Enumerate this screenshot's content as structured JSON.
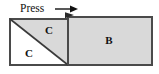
{
  "figure": {
    "background_color": "#ffffff",
    "outline_color": "#4a4a4a",
    "fill_gray": "#d9d9d9",
    "fill_white": "#ffffff",
    "text_color": "#111111"
  },
  "annotation": {
    "press_label": "Press",
    "arrow_name": "press-direction-arrow",
    "arrow_direction": "right"
  },
  "regions": [
    {
      "id": "region-c-upper",
      "label": "C",
      "fill": "#d9d9d9",
      "shape": "triangle",
      "x": 49,
      "y": 31
    },
    {
      "id": "region-c-lower",
      "label": "C",
      "fill": "#ffffff",
      "shape": "triangle",
      "x": 29,
      "y": 54
    },
    {
      "id": "region-b",
      "label": "B",
      "fill": "#d9d9d9",
      "shape": "parallelogram",
      "x": 109,
      "y": 41
    }
  ],
  "geometry": {
    "left_block": {
      "top_left_x": 10,
      "top_left_y": 19,
      "bottom_right_x": 68,
      "bottom_right_y": 65
    },
    "right_block": {
      "top_left_x": 68,
      "top_left_y": 17,
      "bottom_right_x": 152,
      "bottom_right_y": 65
    },
    "diagonal": {
      "x1": 10,
      "y1": 19,
      "x2": 68,
      "y2": 65
    },
    "divider": {
      "x": 68,
      "y1": 17,
      "y2": 65
    }
  }
}
